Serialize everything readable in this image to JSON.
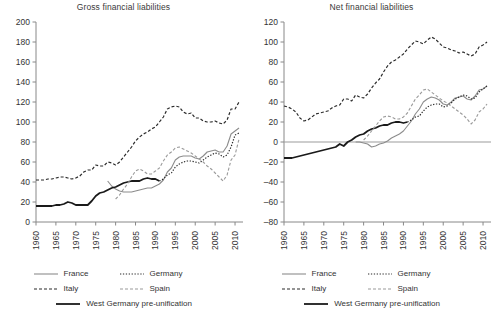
{
  "figure": {
    "width": 495,
    "height": 315,
    "background": "#ffffff"
  },
  "legend": {
    "rows": [
      [
        {
          "key": "france",
          "label": "France",
          "style": "solid-gray"
        },
        {
          "key": "germany",
          "label": "Germany",
          "style": "dotted-black"
        }
      ],
      [
        {
          "key": "italy",
          "label": "Italy",
          "style": "dashed-black"
        },
        {
          "key": "spain",
          "label": "Spain",
          "style": "dashed-gray"
        }
      ],
      [
        {
          "key": "west_germany",
          "label": "West Germany pre-unification",
          "style": "solid-black-thick"
        }
      ]
    ]
  },
  "colors": {
    "france": "#8c8c8c",
    "germany": "#2b2b2b",
    "italy": "#2b2b2b",
    "spain": "#9a9a9a",
    "west_germany": "#1a1a1a",
    "axis": "#888888",
    "text": "#333333",
    "zero_line": "#9b9b9b"
  },
  "chart_data": [
    {
      "id": "gross-financial-liabilities",
      "type": "line",
      "title": "Gross financial liabilities",
      "xlabel": "",
      "ylabel": "",
      "xlim": [
        1960,
        2012
      ],
      "ylim": [
        0,
        200
      ],
      "yticks": [
        0,
        20,
        40,
        60,
        80,
        100,
        120,
        140,
        160,
        180,
        200
      ],
      "xticks": [
        1960,
        1965,
        1970,
        1975,
        1980,
        1985,
        1990,
        1995,
        2000,
        2005,
        2010
      ],
      "grid": false,
      "legend_position": "below",
      "series": [
        {
          "name": "Italy",
          "style": "dashed-black",
          "x": [
            1960,
            1961,
            1962,
            1963,
            1964,
            1965,
            1966,
            1967,
            1968,
            1969,
            1970,
            1971,
            1972,
            1973,
            1974,
            1975,
            1976,
            1977,
            1978,
            1979,
            1980,
            1981,
            1982,
            1983,
            1984,
            1985,
            1986,
            1987,
            1988,
            1989,
            1990,
            1991,
            1992,
            1993,
            1994,
            1995,
            1996,
            1997,
            1998,
            1999,
            2000,
            2001,
            2002,
            2003,
            2004,
            2005,
            2006,
            2007,
            2008,
            2009,
            2010,
            2011
          ],
          "values": [
            42,
            42,
            42,
            43,
            43,
            44,
            45,
            45,
            44,
            43,
            44,
            46,
            50,
            52,
            52,
            57,
            56,
            56,
            60,
            59,
            57,
            60,
            65,
            70,
            75,
            81,
            85,
            88,
            90,
            93,
            95,
            100,
            105,
            113,
            115,
            116,
            115,
            110,
            108,
            109,
            104,
            104,
            101,
            100,
            100,
            101,
            99,
            98,
            102,
            113,
            113,
            120
          ]
        },
        {
          "name": "France",
          "style": "solid-gray",
          "x": [
            1978,
            1979,
            1980,
            1981,
            1982,
            1983,
            1984,
            1985,
            1986,
            1987,
            1988,
            1989,
            1990,
            1991,
            1992,
            1993,
            1994,
            1995,
            1996,
            1997,
            1998,
            1999,
            2000,
            2001,
            2002,
            2003,
            2004,
            2005,
            2006,
            2007,
            2008,
            2009,
            2010,
            2011
          ],
          "values": [
            41,
            36,
            33,
            31,
            30,
            30,
            30,
            31,
            32,
            33,
            34,
            34,
            36,
            38,
            42,
            50,
            54,
            62,
            65,
            66,
            66,
            66,
            64,
            63,
            66,
            70,
            71,
            72,
            70,
            70,
            76,
            88,
            91,
            94
          ]
        },
        {
          "name": "West Germany pre-unification",
          "style": "solid-black-thick",
          "x": [
            1960,
            1961,
            1962,
            1963,
            1964,
            1965,
            1966,
            1967,
            1968,
            1969,
            1970,
            1971,
            1972,
            1973,
            1974,
            1975,
            1976,
            1977,
            1978,
            1979,
            1980,
            1981,
            1982,
            1983,
            1984,
            1985,
            1986,
            1987,
            1988,
            1989,
            1990,
            1991
          ],
          "values": [
            16,
            16,
            16,
            16,
            16,
            17,
            17,
            18,
            20,
            19,
            17,
            17,
            17,
            17,
            21,
            26,
            29,
            30,
            32,
            34,
            35,
            37,
            39,
            40,
            41,
            41,
            41,
            43,
            44,
            43,
            43,
            41
          ]
        },
        {
          "name": "Germany",
          "style": "dotted-black",
          "x": [
            1991,
            1992,
            1993,
            1994,
            1995,
            1996,
            1997,
            1998,
            1999,
            2000,
            2001,
            2002,
            2003,
            2004,
            2005,
            2006,
            2007,
            2008,
            2009,
            2010,
            2011
          ],
          "values": [
            41,
            43,
            47,
            49,
            55,
            58,
            60,
            61,
            61,
            60,
            59,
            62,
            65,
            67,
            69,
            68,
            65,
            67,
            75,
            87,
            89
          ]
        },
        {
          "name": "Spain",
          "style": "dashed-gray",
          "x": [
            1980,
            1981,
            1982,
            1983,
            1984,
            1985,
            1986,
            1987,
            1988,
            1989,
            1990,
            1991,
            1992,
            1993,
            1994,
            1995,
            1996,
            1997,
            1998,
            1999,
            2000,
            2001,
            2002,
            2003,
            2004,
            2005,
            2006,
            2007,
            2008,
            2009,
            2010,
            2011
          ],
          "values": [
            23,
            27,
            33,
            38,
            45,
            51,
            53,
            51,
            48,
            48,
            51,
            54,
            61,
            67,
            70,
            74,
            75,
            73,
            71,
            69,
            66,
            63,
            60,
            56,
            53,
            49,
            45,
            41,
            47,
            62,
            67,
            83
          ]
        }
      ]
    },
    {
      "id": "net-financial-liabilities",
      "type": "line",
      "title": "Net financial liabilities",
      "xlabel": "",
      "ylabel": "",
      "xlim": [
        1960,
        2012
      ],
      "ylim": [
        -80,
        120
      ],
      "yticks": [
        -80,
        -60,
        -40,
        -20,
        0,
        20,
        40,
        60,
        80,
        100,
        120
      ],
      "xticks": [
        1960,
        1965,
        1970,
        1975,
        1980,
        1985,
        1990,
        1995,
        2000,
        2005,
        2010
      ],
      "grid": false,
      "zero_line": 0,
      "legend_position": "below",
      "series": [
        {
          "name": "Italy",
          "style": "dashed-black",
          "x": [
            1960,
            1961,
            1962,
            1963,
            1964,
            1965,
            1966,
            1967,
            1968,
            1969,
            1970,
            1971,
            1972,
            1973,
            1974,
            1975,
            1976,
            1977,
            1978,
            1979,
            1980,
            1981,
            1982,
            1983,
            1984,
            1985,
            1986,
            1987,
            1988,
            1989,
            1990,
            1991,
            1992,
            1993,
            1994,
            1995,
            1996,
            1997,
            1998,
            1999,
            2000,
            2001,
            2002,
            2003,
            2004,
            2005,
            2006,
            2007,
            2008,
            2009,
            2010,
            2011
          ],
          "values": [
            36,
            35,
            33,
            30,
            24,
            21,
            22,
            25,
            28,
            29,
            30,
            31,
            34,
            36,
            37,
            43,
            43,
            41,
            47,
            45,
            44,
            48,
            54,
            59,
            63,
            70,
            76,
            80,
            82,
            85,
            88,
            93,
            97,
            101,
            100,
            98,
            102,
            105,
            103,
            99,
            95,
            94,
            92,
            91,
            89,
            90,
            88,
            86,
            88,
            95,
            97,
            100
          ]
        },
        {
          "name": "France",
          "style": "solid-gray",
          "x": [
            1978,
            1979,
            1980,
            1981,
            1982,
            1983,
            1984,
            1985,
            1986,
            1987,
            1988,
            1989,
            1990,
            1991,
            1992,
            1993,
            1994,
            1995,
            1996,
            1997,
            1998,
            1999,
            2000,
            2001,
            2002,
            2003,
            2004,
            2005,
            2006,
            2007,
            2008,
            2009,
            2010,
            2011
          ],
          "values": [
            0,
            0,
            -1,
            -2,
            -5,
            -4,
            -2,
            -1,
            1,
            4,
            6,
            8,
            11,
            16,
            21,
            28,
            33,
            40,
            43,
            45,
            44,
            42,
            38,
            37,
            40,
            44,
            45,
            46,
            43,
            42,
            46,
            52,
            53,
            56
          ]
        },
        {
          "name": "West Germany pre-unification",
          "style": "solid-black-thick",
          "x": [
            1960,
            1961,
            1962,
            1963,
            1964,
            1965,
            1966,
            1967,
            1968,
            1969,
            1970,
            1971,
            1972,
            1973,
            1974,
            1975,
            1976,
            1977,
            1978,
            1979,
            1980,
            1981,
            1982,
            1983,
            1984,
            1985,
            1986,
            1987,
            1988,
            1989,
            1990,
            1991
          ],
          "values": [
            -16,
            -16,
            -16,
            -15,
            -14,
            -13,
            -12,
            -11,
            -10,
            -9,
            -8,
            -7,
            -6,
            -5,
            -2,
            -4,
            0,
            2,
            5,
            7,
            8,
            11,
            13,
            14,
            16,
            17,
            17,
            19,
            20,
            20,
            19,
            20
          ]
        },
        {
          "name": "Germany",
          "style": "dotted-black",
          "x": [
            1991,
            1992,
            1993,
            1994,
            1995,
            1996,
            1997,
            1998,
            1999,
            2000,
            2001,
            2002,
            2003,
            2004,
            2005,
            2006,
            2007,
            2008,
            2009,
            2010,
            2011
          ],
          "values": [
            20,
            22,
            25,
            26,
            31,
            35,
            37,
            38,
            38,
            35,
            36,
            39,
            43,
            45,
            47,
            46,
            43,
            44,
            50,
            53,
            56
          ]
        },
        {
          "name": "Spain",
          "style": "dashed-gray",
          "x": [
            1980,
            1981,
            1982,
            1983,
            1984,
            1985,
            1986,
            1987,
            1988,
            1989,
            1990,
            1991,
            1992,
            1993,
            1994,
            1995,
            1996,
            1997,
            1998,
            1999,
            2000,
            2001,
            2002,
            2003,
            2004,
            2005,
            2006,
            2007,
            2008,
            2009,
            2010,
            2011
          ],
          "values": [
            2,
            6,
            11,
            16,
            21,
            25,
            26,
            25,
            23,
            23,
            25,
            29,
            36,
            43,
            47,
            52,
            53,
            50,
            47,
            44,
            41,
            39,
            36,
            33,
            30,
            27,
            23,
            18,
            22,
            30,
            33,
            38
          ]
        }
      ]
    }
  ]
}
